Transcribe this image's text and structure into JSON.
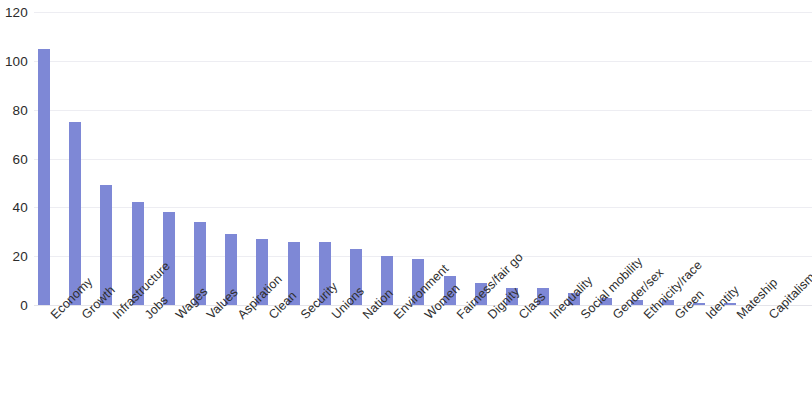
{
  "chart_data": {
    "type": "bar",
    "title": "",
    "subtitle": "",
    "xlabel": "",
    "ylabel": "",
    "ylim": [
      0,
      120
    ],
    "yticks": [
      0,
      20,
      40,
      60,
      80,
      100,
      120
    ],
    "ytick_labels": [
      "0",
      "20",
      "40",
      "60",
      "80",
      "100",
      "120"
    ],
    "grid": true,
    "grid_axis": "y",
    "legend": false,
    "legend_position": "none",
    "bar_color": "#7e88d6",
    "background_color": "#ffffff",
    "gridline_color": "#ededf2",
    "tick_label_rotation": -45,
    "categories": [
      "Economy",
      "Growth",
      "Infrastructure",
      "Jobs",
      "Wages",
      "Values",
      "Aspiration",
      "Clean",
      "Security",
      "Unions",
      "Nation",
      "Environment",
      "Women",
      "Fairness/fair go",
      "Dignity",
      "Class",
      "Inequality",
      "Social mobility",
      "Gender/sex",
      "Ethnicity/race",
      "Green",
      "Identity",
      "Mateship",
      "Capitalism"
    ],
    "values": [
      105,
      75,
      49,
      42,
      38,
      34,
      29,
      27,
      26,
      26,
      23,
      20,
      19,
      12,
      9,
      7,
      7,
      5,
      3,
      2,
      2,
      1,
      1,
      0
    ]
  }
}
